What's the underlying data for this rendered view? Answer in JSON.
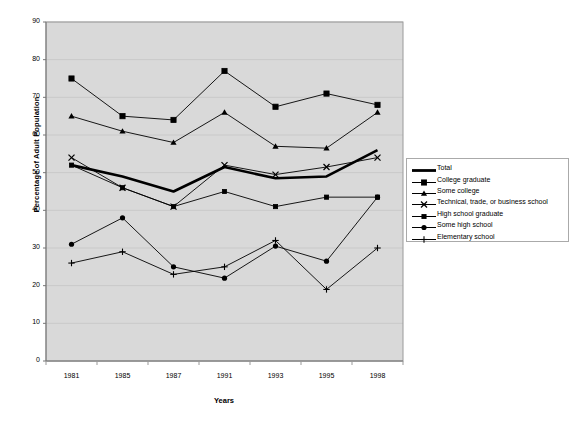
{
  "chart_data": {
    "type": "line",
    "title": "",
    "xlabel": "Years",
    "ylabel": "Percentage of Adult Population",
    "categories": [
      "1981",
      "1985",
      "1987",
      "1991",
      "1993",
      "1995",
      "1998"
    ],
    "x": [
      1981,
      1985,
      1987,
      1991,
      1993,
      1995,
      1998
    ],
    "ylim": [
      0,
      90
    ],
    "yticks": [
      "0",
      "10",
      "20",
      "30",
      "40",
      "50",
      "60",
      "70",
      "80",
      "90"
    ],
    "grid": true,
    "legend_position": "right",
    "series": [
      {
        "name": "Total",
        "marker": "none",
        "line_width": "thick",
        "values": [
          52,
          49,
          45,
          51.5,
          48.5,
          49,
          56
        ]
      },
      {
        "name": "College graduate",
        "marker": "square",
        "line_width": "thin",
        "values": [
          75,
          65,
          64,
          77,
          67.5,
          71,
          68
        ]
      },
      {
        "name": "Some college",
        "marker": "triangle",
        "line_width": "thin",
        "values": [
          65,
          61,
          58,
          66,
          57,
          56.5,
          66
        ]
      },
      {
        "name": "Technical, trade, or business school",
        "marker": "cross-x",
        "line_width": "thin",
        "values": [
          54,
          46,
          41,
          52,
          49.5,
          51.5,
          54
        ]
      },
      {
        "name": "High school graduate",
        "marker": "small-square",
        "line_width": "thin",
        "values": [
          52,
          46,
          41,
          45,
          41,
          43.5,
          43.5
        ]
      },
      {
        "name": "Some high school",
        "marker": "circle",
        "line_width": "thin",
        "values": [
          31,
          38,
          25,
          22,
          30.5,
          26.5,
          43.5
        ]
      },
      {
        "name": "Elementary school",
        "marker": "plus",
        "line_width": "thin",
        "values": [
          26,
          29,
          23,
          25,
          32,
          19,
          30
        ]
      }
    ]
  },
  "axes": {
    "ylabel": "Percentage of Adult Population",
    "xlabel": "Years",
    "yticks": [
      "90",
      "80",
      "70",
      "60",
      "50",
      "40",
      "30",
      "20",
      "10",
      "0"
    ],
    "xticks": [
      "1981",
      "1985",
      "1987",
      "1991",
      "1993",
      "1995",
      "1998"
    ]
  },
  "legend": {
    "items": [
      {
        "label": "Total"
      },
      {
        "label": "College graduate"
      },
      {
        "label": "Some college"
      },
      {
        "label": "Technical, trade, or business school"
      },
      {
        "label": "High school graduate"
      },
      {
        "label": "Some high school"
      },
      {
        "label": "Elementary school"
      }
    ]
  },
  "colors": {
    "plot_background": "#d9d9d9",
    "page_background": "#ffffff",
    "line": "#000000",
    "gridline": "#c9c9c9",
    "axis": "#9a9a9a",
    "legend_border": "#aaaaaa"
  }
}
